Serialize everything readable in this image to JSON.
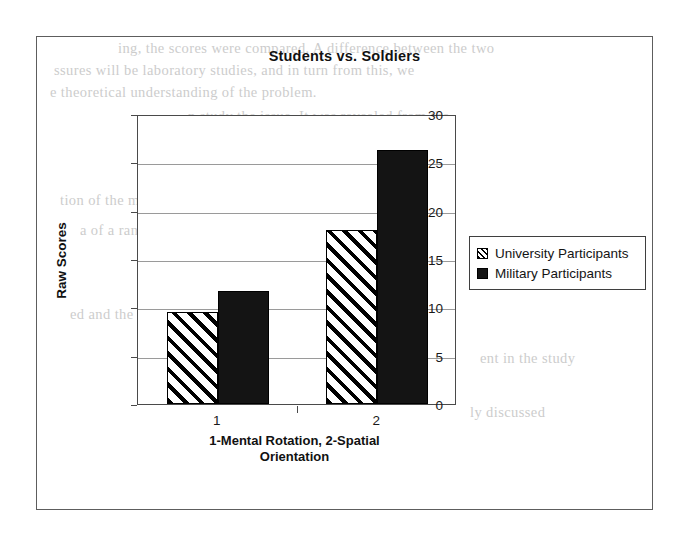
{
  "chart_data": {
    "type": "bar",
    "title": "Students vs. Soldiers",
    "xlabel": "1-Mental Rotation, 2-Spatial Orientation",
    "ylabel": "Raw Scores",
    "categories": [
      "1",
      "2"
    ],
    "ylim": [
      0,
      30
    ],
    "yticks": [
      0,
      5,
      10,
      15,
      20,
      25,
      30
    ],
    "ytick_labels": [
      "0",
      "5",
      "10",
      "15",
      "20",
      "25",
      "30"
    ],
    "grid": true,
    "legend_position": "right",
    "series": [
      {
        "name": "University Participants",
        "values": [
          9.5,
          18.0
        ],
        "fill": "diagonal-hatch",
        "color": "#000000"
      },
      {
        "name": "Military Participants",
        "values": [
          11.7,
          26.3
        ],
        "fill": "solid",
        "color": "#141414"
      }
    ]
  },
  "xlabel_lines": [
    "1-Mental Rotation, 2-Spatial",
    "Orientation"
  ],
  "background_text": {
    "lines": [
      "ing, the scores were compared. A difference between the two",
      "ssures will be laboratory studies, and in turn from this, we",
      "e theoretical understanding of the problem.",
      "n study the issue. It was revealed from the",
      "to further of participants with real of",
      "cal problem. The reported scores from the",
      "tion of the measurement and still",
      "a of a range of the tested groups",
      "tally was not significantly",
      "ed and the results of the",
      "ent in the study",
      "ly discussed"
    ]
  }
}
